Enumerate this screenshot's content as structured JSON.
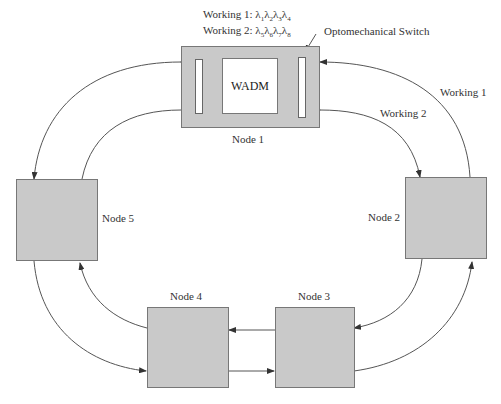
{
  "legend": {
    "working1": {
      "prefix": "Working 1: ",
      "wavelengths": [
        "λ",
        "1",
        "λ",
        "2",
        "λ",
        "3",
        "λ",
        "4"
      ]
    },
    "working2": {
      "prefix": "Working 2: ",
      "wavelengths": [
        "λ",
        "5",
        "λ",
        "6",
        "λ",
        "7",
        "λ",
        "8"
      ]
    }
  },
  "labels": {
    "switch": "Optomechanical Switch",
    "wadm": "WADM",
    "working1_ring": "Working 1",
    "working2_ring": "Working 2"
  },
  "nodes": [
    {
      "id": "node1",
      "label": "Node 1"
    },
    {
      "id": "node2",
      "label": "Node 2"
    },
    {
      "id": "node3",
      "label": "Node 3"
    },
    {
      "id": "node4",
      "label": "Node 4"
    },
    {
      "id": "node5",
      "label": "Node 5"
    }
  ],
  "colors": {
    "node_fill": "#c9c9c9",
    "line": "#444444",
    "background": "#ffffff"
  }
}
